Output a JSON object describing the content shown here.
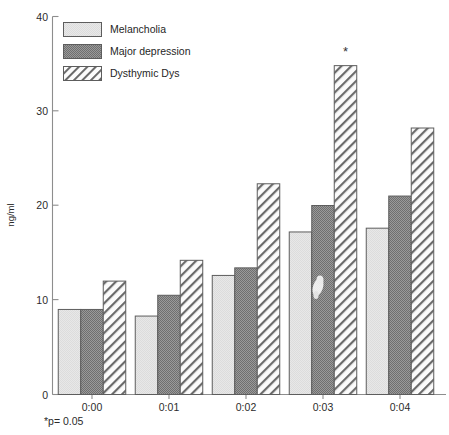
{
  "chart_data": {
    "type": "bar",
    "title": "",
    "xlabel": "",
    "ylabel": "ng/ml",
    "categories": [
      "0:00",
      "0:01",
      "0:02",
      "0:03",
      "0:04"
    ],
    "series": [
      {
        "name": "Melancholia",
        "values": [
          9.0,
          8.3,
          12.6,
          17.2,
          17.6
        ]
      },
      {
        "name": "Major depression",
        "values": [
          9.0,
          10.5,
          13.4,
          20.0,
          21.0
        ]
      },
      {
        "name": "Dysthymic Dys",
        "values": [
          12.0,
          14.2,
          22.3,
          34.8,
          28.2
        ]
      }
    ],
    "ylim": [
      0,
      40
    ],
    "yticks": [
      0,
      10,
      20,
      30,
      40
    ],
    "ytick_labels": [
      "0",
      "10",
      "20",
      "30",
      "40"
    ],
    "grid": false,
    "legend_position": "top-left",
    "annotations": [
      {
        "text": "*",
        "category": "0:03",
        "series": "Dysthymic Dys",
        "value": 34.8
      }
    ],
    "footnote": "*p= 0.05"
  },
  "legend": {
    "items": [
      {
        "label": "Melancholia",
        "pattern": "solid-light",
        "color": "#e2e2e2"
      },
      {
        "label": "Major depression",
        "pattern": "checker-dark",
        "color": "#8f8f8f"
      },
      {
        "label": "Dysthymic Dys",
        "pattern": "diagonal-hatch",
        "color": "#ffffff"
      }
    ]
  },
  "axis": {
    "y_label": "ng/ml",
    "y_tick_labels": [
      "40",
      "30",
      "20",
      "10",
      "0"
    ],
    "x_tick_labels": [
      "0:00",
      "0:01",
      "0:02",
      "0:03",
      "0:04"
    ]
  },
  "footnote": {
    "text": "*p= 0.05"
  },
  "significance": {
    "marker": "*"
  },
  "colors": {
    "series_1": "#e2e2e2",
    "series_2": "#8f8f8f",
    "series_3": "#ffffff",
    "outline": "#5d5d5d",
    "axis": "#8d8d8d",
    "text": "#2b2b2b"
  }
}
